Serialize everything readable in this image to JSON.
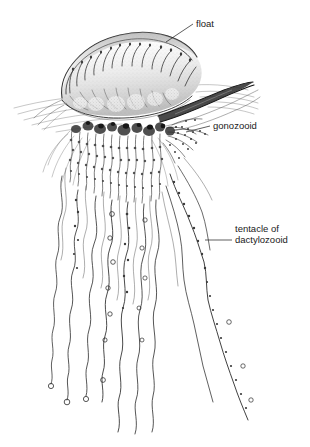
{
  "figure": {
    "style": "black-and-white stippled pen-and-ink scientific drawing",
    "background_color": "#ffffff",
    "ink_color": "#2b2b2b",
    "width": 310,
    "height": 447
  },
  "labels": [
    {
      "id": "float",
      "text": "float",
      "text_x": 196,
      "text_y": 27,
      "anchor": "start",
      "leader": "M193,24 L166,42",
      "points_to": "pneumatophore-crest"
    },
    {
      "id": "gonozooid",
      "text": "gonozooid",
      "text_x": 213,
      "text_y": 129,
      "anchor": "start",
      "leader": "M210,126 L186,132",
      "points_to": "gonozooid-cluster"
    },
    {
      "id": "tentacle-of-dactylozooid",
      "text": "tentacle of",
      "text2": "dactylozooid",
      "text_x": 235,
      "text_y": 232,
      "text2_y": 243,
      "anchor": "start",
      "leader": "M232,240 L205,240",
      "points_to": "long-fishing-tentacle"
    }
  ],
  "parts": {
    "float": "float",
    "gonozooid": "gonozooid",
    "tentacle": "tentacle of dactylozooid"
  }
}
